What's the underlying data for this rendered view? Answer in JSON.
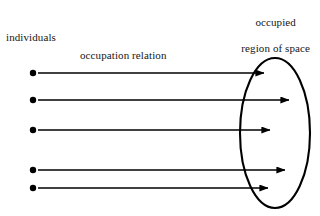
{
  "diagram": {
    "title_text": "occupation relation diagram",
    "background_color": "#ffffff",
    "stroke_color": "#000000",
    "text_color": "#161616",
    "labels": {
      "individuals": "individuals",
      "occupation_relation": "occupation relation",
      "occupied_region_line1": "occupied",
      "occupied_region_line2": "region of space"
    },
    "individual_nodes": [
      {
        "id": "individual-1",
        "cx": 33,
        "cy": 73,
        "r": 3.2
      },
      {
        "id": "individual-2",
        "cx": 33,
        "cy": 100,
        "r": 3.2
      },
      {
        "id": "individual-3",
        "cx": 33,
        "cy": 130,
        "r": 3.2
      },
      {
        "id": "individual-4",
        "cx": 33,
        "cy": 170,
        "r": 3.2
      },
      {
        "id": "individual-5",
        "cx": 33,
        "cy": 188,
        "r": 3.2
      }
    ],
    "relation_arrows": [
      {
        "id": "arrow-1",
        "x1": 38,
        "y1": 73,
        "x2": 264,
        "y2": 73
      },
      {
        "id": "arrow-2",
        "x1": 38,
        "y1": 100,
        "x2": 289,
        "y2": 100
      },
      {
        "id": "arrow-3",
        "x1": 38,
        "y1": 130,
        "x2": 270,
        "y2": 130
      },
      {
        "id": "arrow-4",
        "x1": 38,
        "y1": 170,
        "x2": 285,
        "y2": 170
      },
      {
        "id": "arrow-5",
        "x1": 38,
        "y1": 188,
        "x2": 268,
        "y2": 188
      }
    ],
    "region_ellipse": {
      "cx": 275,
      "cy": 133,
      "rx": 35,
      "ry": 75,
      "stroke_width": 2.1,
      "fill": "none"
    }
  }
}
